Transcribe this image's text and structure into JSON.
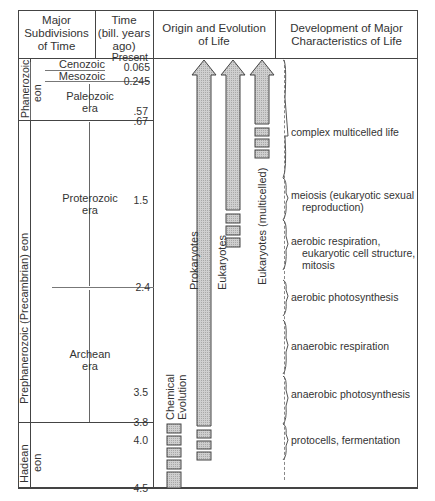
{
  "headers": {
    "subdivisions": [
      "Major",
      "Subdivisions",
      "of Time"
    ],
    "time": [
      "Time",
      "(bill. years",
      "ago)"
    ],
    "origin": [
      "Origin and Evolution",
      "of Life"
    ],
    "development": [
      "Development of Major",
      "Characteristics of Life"
    ]
  },
  "time_ticks": [
    {
      "label": "Present",
      "y": 58
    },
    {
      "label": "0.065",
      "y": 66
    },
    {
      "label": "0.245",
      "y": 80
    },
    {
      "label": ".57",
      "y": 111
    },
    {
      "label": ".67",
      "y": 120
    },
    {
      "label": "1.5",
      "y": 200
    },
    {
      "label": "2.4",
      "y": 287
    },
    {
      "label": "3.5",
      "y": 392
    },
    {
      "label": "3.8",
      "y": 422
    },
    {
      "label": "4.0",
      "y": 440
    },
    {
      "label": "4.5",
      "y": 488
    }
  ],
  "eons": {
    "phanerozoic": [
      "Phanerozoic",
      "eon"
    ],
    "prephanerozoic": "Prephanerozoic (Precambrian) eon",
    "hadean": [
      "Hadean",
      "eon"
    ]
  },
  "eras": {
    "cenozoic": "Cenozoic",
    "mesozoic": "Mesozoic",
    "paleozoic": [
      "Paleozoic",
      "era"
    ],
    "proterozoic": [
      "Proterozoic",
      "era"
    ],
    "archean": [
      "Archean",
      "era"
    ]
  },
  "lineages": {
    "chemical_evolution": [
      "Chemical",
      "Evolution"
    ],
    "prokaryotes": "Prokaryotes",
    "eukaryotes": "Eukaryotes",
    "eukaryotes_multicelled": "Eukaryotes (multicelled)"
  },
  "characteristics": [
    {
      "lines": [
        "complex  multicelled life"
      ]
    },
    {
      "lines": [
        "meiosis (eukaryotic sexual",
        "reproduction)"
      ]
    },
    {
      "lines": [
        "aerobic respiration,",
        "eukaryotic cell structure,",
        "mitosis"
      ]
    },
    {
      "lines": [
        "aerobic photosynthesis"
      ]
    },
    {
      "lines": [
        "anaerobic respiration"
      ]
    },
    {
      "lines": [
        "anaerobic photosynthesis"
      ]
    },
    {
      "lines": [
        "protocells, fermentation"
      ]
    }
  ]
}
